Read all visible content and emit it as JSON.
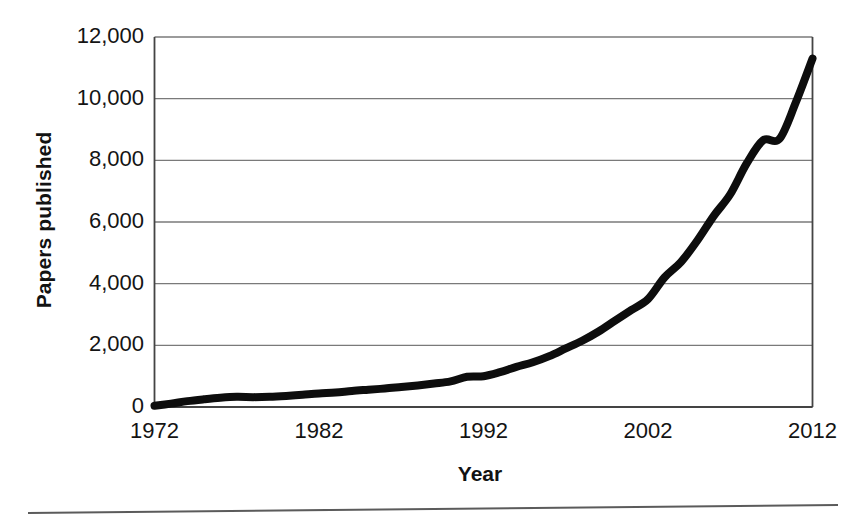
{
  "chart_data": {
    "type": "line",
    "title": "",
    "xlabel": "Year",
    "ylabel": "Papers published",
    "xlim": [
      1972,
      2012
    ],
    "ylim": [
      0,
      12000
    ],
    "grid": true,
    "legend": false,
    "x_tick_labels": [
      "1972",
      "1982",
      "1992",
      "2002",
      "2012"
    ],
    "x_tick_values": [
      1972,
      1982,
      1992,
      2002,
      2012
    ],
    "y_tick_labels": [
      "0",
      "2,000",
      "4,000",
      "6,000",
      "8,000",
      "10,000",
      "12,000"
    ],
    "y_tick_values": [
      0,
      2000,
      4000,
      6000,
      8000,
      10000,
      12000
    ],
    "series": [
      {
        "name": "Papers published",
        "color": "#000000",
        "x": [
          1972,
          1973,
          1974,
          1975,
          1976,
          1977,
          1978,
          1979,
          1980,
          1981,
          1982,
          1983,
          1984,
          1985,
          1986,
          1987,
          1988,
          1989,
          1990,
          1991,
          1992,
          1993,
          1994,
          1995,
          1996,
          1997,
          1998,
          1999,
          2000,
          2001,
          2002,
          2003,
          2004,
          2005,
          2006,
          2007,
          2008,
          2009,
          2010,
          2011,
          2012
        ],
        "values": [
          40,
          110,
          190,
          250,
          300,
          330,
          320,
          330,
          360,
          400,
          440,
          470,
          520,
          560,
          600,
          650,
          700,
          760,
          830,
          980,
          1000,
          1130,
          1300,
          1450,
          1650,
          1900,
          2150,
          2450,
          2800,
          3150,
          3500,
          4200,
          4700,
          5400,
          6200,
          6900,
          7900,
          8650,
          8700,
          9900,
          11300
        ]
      }
    ]
  },
  "figure": {
    "axis_color": "#444444",
    "grid_color": "#7a7a7a",
    "line_color": "#0d0d0d",
    "line_width": 8,
    "background": "#ffffff",
    "footer_rule": true
  }
}
